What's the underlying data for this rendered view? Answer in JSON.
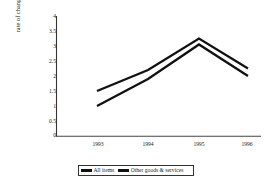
{
  "chart_data": {
    "type": "line",
    "title": "",
    "xlabel": "",
    "ylabel": "rate of change of prices (% p.a.)",
    "categories": [
      "1993",
      "1994",
      "1995",
      "1996"
    ],
    "ylim": [
      0,
      4
    ],
    "yticks": [
      "0",
      "0.5",
      "1",
      "1.5",
      "2",
      "2.5",
      "3",
      "3.5",
      "4"
    ],
    "grid": false,
    "legend_position": "bottom",
    "series": [
      {
        "name": "All items",
        "values": [
          1.5,
          2.2,
          3.25,
          2.25
        ],
        "color": "#111111"
      },
      {
        "name": "Other goods & services",
        "values": [
          1.0,
          1.9,
          3.05,
          2.0
        ],
        "color": "#111111"
      }
    ]
  },
  "axis": {
    "y_label": "rate of change of prices (% p.a.)",
    "y_tick_0": "0",
    "y_tick_1": "0.5",
    "y_tick_2": "1",
    "y_tick_3": "1.5",
    "y_tick_4": "2",
    "y_tick_5": "2.5",
    "y_tick_6": "3",
    "y_tick_7": "3.5",
    "y_tick_8": "4",
    "x_tick_0": "1993",
    "x_tick_1": "1994",
    "x_tick_2": "1995",
    "x_tick_3": "1996"
  },
  "legend": {
    "series_1_label": "All items",
    "series_2_label": "Other goods & services"
  }
}
